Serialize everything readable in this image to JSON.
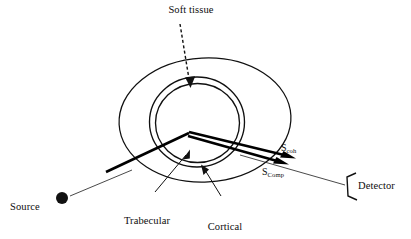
{
  "figure": {
    "labels": {
      "soft_tissue": "Soft tissue",
      "trabecular_bone_line1": "Trabecular",
      "trabecular_bone_line2": "bone",
      "cortical_bone_line1": "Cortical",
      "cortical_bone_line2": "bone",
      "source": "Source",
      "detector": "Detector",
      "s_coh_base": "S",
      "s_coh_sub": "coh",
      "s_comp_base": "S",
      "s_comp_sub": "Comp"
    },
    "colors": {
      "ink": "#111111",
      "background": "#ffffff",
      "beam": "#000000"
    },
    "icons": {
      "source_marker": "filled-circle",
      "detector_marker": "open-bracket",
      "soft_tissue_pointer": "dashed-down-arrow",
      "trabecular_pointer": "solid-arrow-up-right",
      "cortical_pointer": "solid-arrow-up-left",
      "scatter_beam_coh": "thick-arrow-right",
      "scatter_beam_comp": "thick-arrow-right"
    },
    "geometry": {
      "soft_tissue_ellipse": {
        "cx": 205,
        "cy": 120,
        "rx": 86,
        "ry": 62
      },
      "cortical_outer_circle": {
        "cx": 197,
        "cy": 122,
        "rx": 47,
        "ry": 45
      },
      "cortical_inner_circle": {
        "cx": 197,
        "cy": 123,
        "rx": 42,
        "ry": 40
      },
      "source_point": {
        "x": 62,
        "y": 199
      },
      "beam_apex": {
        "x": 189,
        "y": 133
      },
      "detector_point": {
        "x": 345,
        "y": 180
      },
      "scatter_exit_coh": {
        "x": 290,
        "y": 157
      },
      "scatter_exit_comp": {
        "x": 283,
        "y": 163
      }
    }
  }
}
